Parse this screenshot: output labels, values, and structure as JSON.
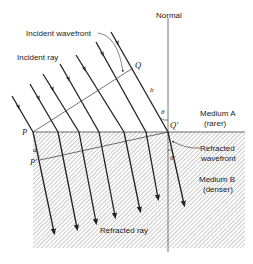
{
  "labels": {
    "normal": "Normal",
    "incident_wavefront": "Incident wavefront",
    "incident_ray": "Incident ray",
    "refracted_wavefront_1": "Refracted",
    "refracted_wavefront_2": "wavefront",
    "refracted_ray": "Refracted ray",
    "medium_a_1": "Medium A",
    "medium_a_2": "(rarer)",
    "medium_b_1": "Medium B",
    "medium_b_2": "(denser)"
  },
  "points": {
    "P": "P",
    "Q": "Q",
    "Q_prime": "Q'",
    "P_prime": "P'",
    "a": "a",
    "b": "b",
    "theta": "θ",
    "theta_prime": "θ'"
  },
  "colors": {
    "ink": "#222222",
    "hatch": "#8a8a8a",
    "background": "#ffffff"
  },
  "ray_count": 7
}
